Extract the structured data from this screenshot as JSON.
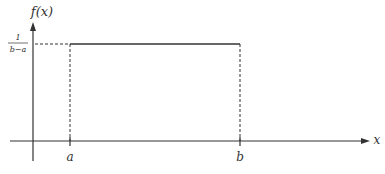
{
  "diagram": {
    "y_axis_label": "f(x)",
    "x_axis_label": "x",
    "density_label": {
      "numerator": "1",
      "denominator": "b−a"
    },
    "x_ticks": [
      {
        "label": "a",
        "x": 70
      },
      {
        "label": "b",
        "x": 240
      }
    ],
    "colors": {
      "axis": "#333333",
      "density_line": "#333333",
      "dashed": "#333333",
      "background": "#ffffff"
    }
  }
}
